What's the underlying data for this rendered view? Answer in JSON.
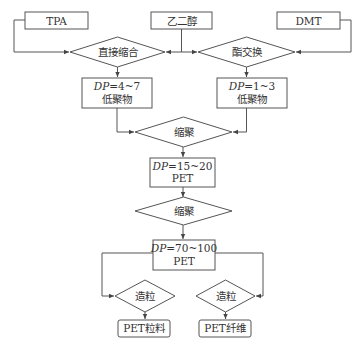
{
  "diagram": {
    "type": "flowchart",
    "inputs": {
      "tpa": "TPA",
      "eg": "乙二醇",
      "dmt": "DMT"
    },
    "processes": {
      "direct_esterification": "直接缩合",
      "transesterification": "酯交换",
      "polycondensation_1": "缩聚",
      "polycondensation_2": "缩聚",
      "pelletize_left": "造粒",
      "pelletize_right": "造粒"
    },
    "intermediates": {
      "oligomer_left": {
        "dp_label": "DP",
        "dp_value": "=4~7",
        "name": "低聚物"
      },
      "oligomer_right": {
        "dp_label": "DP",
        "dp_value": "=1~3",
        "name": "低聚物"
      },
      "pet_low": {
        "dp_label": "DP",
        "dp_value": "=15~20",
        "name": "PET"
      },
      "pet_high": {
        "dp_label": "DP",
        "dp_value": "=70~100",
        "name": "PET"
      }
    },
    "outputs": {
      "pellets": "PET粒料",
      "fiber": "PET纤维"
    },
    "colors": {
      "stroke": "#555555",
      "text": "#333333",
      "background": "#ffffff"
    }
  }
}
